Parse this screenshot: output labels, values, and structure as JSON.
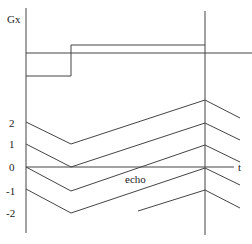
{
  "diagram": {
    "y_axis_label": "Gx",
    "x_axis_label": "t",
    "echo_label": "echo",
    "phase_ticks": [
      "2",
      "1",
      "0",
      "-1",
      "-2"
    ],
    "line_color": "#444444",
    "background": "#ffffff"
  }
}
